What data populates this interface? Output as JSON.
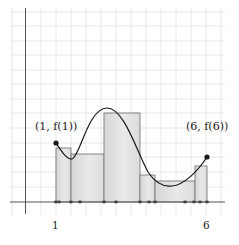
{
  "diagram": {
    "type": "riemann-sum",
    "colors": {
      "grid": "#e2e2e2",
      "axis": "#555555",
      "rect_fill_light": "#ececec",
      "rect_fill_dark": "#d4d4d4",
      "rect_stroke": "#7a7a7a",
      "curve": "#1a1a1a",
      "point": "#1a1a1a"
    },
    "labels": {
      "start_point": "(1, f(1))",
      "end_point": "(6, f(6))",
      "tick_start": "1",
      "tick_end": "6"
    },
    "endpoints": [
      {
        "name": "start",
        "x": 1,
        "label": "(1, f(1))"
      },
      {
        "name": "end",
        "x": 6,
        "label": "(6, f(6))"
      }
    ],
    "rectangles": [
      {
        "index": 1,
        "x_start_px": 56,
        "x_end_px": 71,
        "top_px": 148
      },
      {
        "index": 2,
        "x_start_px": 71,
        "x_end_px": 104,
        "top_px": 154
      },
      {
        "index": 3,
        "x_start_px": 104,
        "x_end_px": 140,
        "top_px": 113
      },
      {
        "index": 4,
        "x_start_px": 140,
        "x_end_px": 155,
        "top_px": 175
      },
      {
        "index": 5,
        "x_start_px": 155,
        "x_end_px": 195,
        "top_px": 181
      },
      {
        "index": 6,
        "x_start_px": 195,
        "x_end_px": 207,
        "top_px": 166
      }
    ],
    "axis_marks_px": [
      56,
      59,
      71,
      80,
      104,
      116,
      140,
      149,
      155,
      185,
      194,
      200,
      207
    ]
  }
}
